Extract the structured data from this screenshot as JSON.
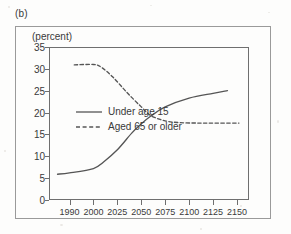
{
  "figure": {
    "panel_label": "(b)",
    "axis_unit_caption": "(percent)"
  },
  "chart_data": {
    "type": "line",
    "title": "",
    "subtitle": "",
    "xlabel": "",
    "ylabel": "(percent)",
    "ylim": [
      0,
      35
    ],
    "yticks": [
      0,
      5,
      10,
      15,
      20,
      25,
      30,
      35
    ],
    "ytick_labels": [
      "0",
      "5",
      "10",
      "15",
      "20",
      "25",
      "30",
      "35"
    ],
    "categories": [
      "1990",
      "2000",
      "2025",
      "2050",
      "2075",
      "2100",
      "2125",
      "2150"
    ],
    "xtick_labels": [
      "1990",
      "2000",
      "2025",
      "2050",
      "2075",
      "2100",
      "2125",
      "2150"
    ],
    "grid": false,
    "legend_position": "center-right-inside",
    "series": [
      {
        "name": "Under age 15",
        "style": "solid",
        "color": "#555555",
        "points": [
          {
            "x": "1985",
            "y": 5.9
          },
          {
            "x": "1990",
            "y": 6.2
          },
          {
            "x": "2000",
            "y": 7.2
          },
          {
            "x": "2010",
            "y": 8.6
          },
          {
            "x": "2025",
            "y": 11.5
          },
          {
            "x": "2040",
            "y": 15.3
          },
          {
            "x": "2050",
            "y": 17.4
          },
          {
            "x": "2060",
            "y": 19.2
          },
          {
            "x": "2075",
            "y": 21.3
          },
          {
            "x": "2100",
            "y": 23.3
          },
          {
            "x": "2125",
            "y": 24.4
          },
          {
            "x": "2140",
            "y": 25.0
          }
        ]
      },
      {
        "name": "Aged 65 or older",
        "style": "dashed",
        "color": "#555555",
        "points": [
          {
            "x": "1992",
            "y": 30.9
          },
          {
            "x": "2000",
            "y": 31.0
          },
          {
            "x": "2008",
            "y": 30.4
          },
          {
            "x": "2020",
            "y": 28.2
          },
          {
            "x": "2035",
            "y": 24.6
          },
          {
            "x": "2050",
            "y": 21.3
          },
          {
            "x": "2060",
            "y": 19.3
          },
          {
            "x": "2075",
            "y": 18.1
          },
          {
            "x": "2090",
            "y": 17.7
          },
          {
            "x": "2110",
            "y": 17.6
          },
          {
            "x": "2130",
            "y": 17.6
          },
          {
            "x": "2152",
            "y": 17.6
          }
        ]
      }
    ],
    "annotations": [],
    "crossover": {
      "approx_x": "2060",
      "approx_y": 19.2
    }
  },
  "legend": {
    "entries": [
      {
        "label": "Under age 15",
        "style": "solid"
      },
      {
        "label": "Aged 65 or older",
        "style": "dashed"
      }
    ]
  }
}
